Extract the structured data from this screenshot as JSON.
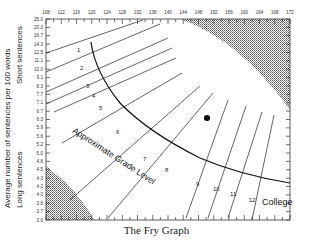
{
  "chart_data": {
    "type": "line",
    "title": "The Fry Graph",
    "xlabel": "Average number of syllables per 100 words",
    "ylabel": "Average number of sentences per 100 words",
    "ylabel_top_region": "Short sentences",
    "ylabel_bottom_region": "Long sentences",
    "x_ticks": [
      108,
      112,
      116,
      120,
      124,
      128,
      132,
      136,
      140,
      144,
      148,
      152,
      156,
      160,
      164,
      168,
      172
    ],
    "y_ticks": [
      "25.0",
      "20.0",
      "16.7",
      "14.3",
      "12.5",
      "11.1",
      "10.0",
      "9.1",
      "8.3",
      "7.7",
      "7.1",
      "6.7",
      "6.3",
      "5.9",
      "5.6",
      "5.2",
      "5.0",
      "4.8",
      "4.5",
      "4.3",
      "4.2",
      "4.0",
      "3.8",
      "3.7",
      "3.6"
    ],
    "xlim": [
      108,
      172
    ],
    "ylim": [
      3.6,
      25.0
    ],
    "grade_levels": [
      "1",
      "2",
      "3",
      "4",
      "5",
      "6",
      "7",
      "8",
      "9",
      "10",
      "11",
      "12",
      "College"
    ],
    "curve_label": "Approximate Grade Level",
    "invalid_regions": [
      "upper-right (short sentences, many syllables)",
      "lower-left (long sentences, few syllables)"
    ],
    "plotted_point": {
      "x": 141,
      "y": 6.6
    },
    "grid": false,
    "legend": null
  },
  "caption": "The Fry Graph"
}
